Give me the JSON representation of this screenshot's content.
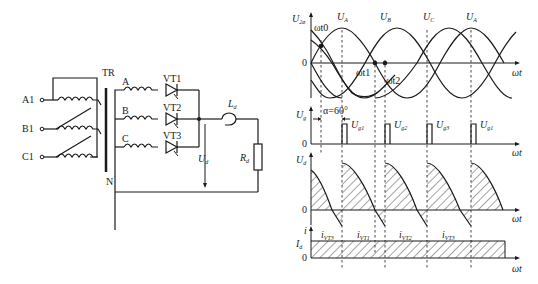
{
  "circuit": {
    "inputs": [
      "A1",
      "B1",
      "C1"
    ],
    "transformer_label": "TR",
    "phases": [
      "A",
      "B",
      "C"
    ],
    "thyristors": [
      "VT1",
      "VT2",
      "VT3"
    ],
    "inductor_label": "L",
    "inductor_sub": "d",
    "resistor_label": "R",
    "resistor_sub": "d",
    "output_voltage_label": "U",
    "output_voltage_sub": "d",
    "neutral_label": "N"
  },
  "waveforms": {
    "phase_panel": {
      "y_label": "U",
      "y_sub": "2ø",
      "peaks": [
        "U",
        "U",
        "U",
        "U"
      ],
      "peak_subs": [
        "A",
        "B",
        "C",
        "A"
      ],
      "zero": "0",
      "x_label": "ωt",
      "points": [
        "ωt0",
        "ωt1",
        "ωt2"
      ]
    },
    "gate_panel": {
      "y_label": "U",
      "y_sub": "g",
      "alpha_label": "α=60°",
      "pulses": [
        "U",
        "U",
        "U",
        "U"
      ],
      "pulse_subs": [
        "g1",
        "g2",
        "g3",
        "g1"
      ],
      "zero": "0",
      "x_label": "ωt"
    },
    "output_panel": {
      "y_label": "U",
      "y_sub": "d",
      "zero": "0",
      "x_label": "ωt"
    },
    "current_panel": {
      "y_label": "i",
      "level_label": "I",
      "level_sub": "d",
      "segments": [
        "i",
        "i",
        "i",
        "i"
      ],
      "segment_subs": [
        "VT3",
        "VT1",
        "VT2",
        "VT3"
      ],
      "zero": "0",
      "x_label": "ωt"
    }
  }
}
